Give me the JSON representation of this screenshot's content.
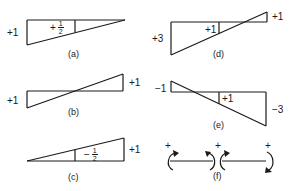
{
  "panels": {
    "a": {
      "caption": "(a)",
      "left_value": "+1",
      "inner_sign": "+",
      "inner_num": "1",
      "inner_den": "2"
    },
    "b": {
      "caption": "(b)",
      "left_value": "+1",
      "right_value": "+1"
    },
    "c": {
      "caption": "(c)",
      "inner_sign": "−",
      "inner_num": "1",
      "inner_den": "2",
      "right_value": "+1"
    },
    "d": {
      "caption": "(d)",
      "left_value": "+3",
      "inner_value": "+1",
      "right_value": "+1"
    },
    "e": {
      "caption": "(e)",
      "left_value": "−1",
      "inner_value": "+1",
      "right_value": "−3"
    },
    "f": {
      "caption": "(f)",
      "signs": [
        "+",
        "+",
        "+"
      ]
    }
  },
  "colors": {
    "line": "#1a1a1a",
    "background": "#ffffff"
  }
}
